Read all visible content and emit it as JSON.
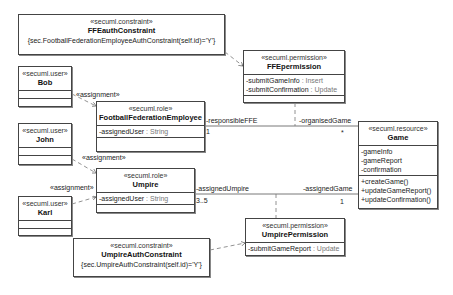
{
  "diagram": {
    "elements": {
      "ffe_auth_constraint": {
        "stereotype": "«secuml.constraint»",
        "name": "FFEauthConstraint",
        "constraint": "{sec.FootballFederationEmployeeAuthConstraint(self.id)='Y'}"
      },
      "ffe_permission": {
        "stereotype": "«secuml.permission»",
        "name": "FFEpermission",
        "attributes": [
          {
            "name": "-submitGameInfo",
            "type": " : Insert"
          },
          {
            "name": "-submitConfirmation",
            "type": " : Update"
          }
        ]
      },
      "bob": {
        "stereotype": "«secuml.user»",
        "name": "Bob"
      },
      "john": {
        "stereotype": "«secuml.user»",
        "name": "John"
      },
      "karl": {
        "stereotype": "«secuml.user»",
        "name": "Karl"
      },
      "ffe_role": {
        "stereotype": "«secuml.role»",
        "name": "FootballFederationEmployee",
        "attributes": [
          {
            "name": "-assignedUser",
            "type": " : String"
          }
        ]
      },
      "umpire_role": {
        "stereotype": "«secuml.role»",
        "name": "Umpire",
        "attributes": [
          {
            "name": "-assignedUser",
            "type": " : String"
          }
        ]
      },
      "game": {
        "stereotype": "«secuml.resource»",
        "name": "Game",
        "attributes": [
          "-gameInfo",
          "-gameReport",
          "-confirmation"
        ],
        "operations": [
          "+createGame()",
          "+updateGameReport()",
          "+updateConfirmation()"
        ]
      },
      "umpire_permission": {
        "stereotype": "«secuml.permission»",
        "name": "UmpirePermission",
        "attributes": [
          {
            "name": "-submitGameReport",
            "type": " : Update"
          }
        ]
      },
      "umpire_auth_constraint": {
        "stereotype": "«secuml.constraint»",
        "name": "UmpireAuthConstraint",
        "constraint": "{sec.UmpireAuthConstraint(self.id)='Y'}"
      }
    },
    "labels": {
      "assignment_bob": "«assignment»",
      "assignment_john": "«assignment»",
      "assignment_karl": "«assignment»",
      "responsible_ffe": "-responsibleFFE",
      "responsible_ffe_mult": "1",
      "organised_game": "-organisedGame",
      "organised_game_mult": "*",
      "assigned_umpire": "-assignedUmpire",
      "assigned_umpire_mult": "3..5",
      "assigned_game": "-assignedGame",
      "assigned_game_mult": "1"
    }
  }
}
